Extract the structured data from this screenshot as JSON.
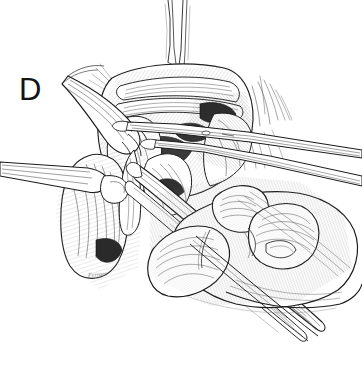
{
  "figure": {
    "panel_label": "D",
    "artist_signature": "Ferraro",
    "medium": "pen-and-ink line drawing",
    "background_color": "#ffffff",
    "ink_color": "#1a1a1a",
    "shadow_color": "#2b2b2b",
    "midtone_color": "#888888",
    "width": 362,
    "height": 381
  },
  "scene": {
    "description": "Pen-and-ink surgical illustration showing a retracted operative field held open with rake retractors and suture stay-sutures, while a gloved hand steadies long forceps and a dissecting instrument within the wound.",
    "elements": [
      {
        "name": "operative-field",
        "label": "Retracted operative field"
      },
      {
        "name": "rake-retractor-left",
        "label": "Rake retractor, left"
      },
      {
        "name": "rake-retractor-lower-left",
        "label": "Rake retractor, lower left"
      },
      {
        "name": "stay-sutures-superior",
        "label": "Superior stay sutures"
      },
      {
        "name": "suture-tails-right",
        "label": "Suture tails, right"
      },
      {
        "name": "forceps-upper",
        "label": "Long tissue forceps"
      },
      {
        "name": "forceps-lower",
        "label": "Second forceps / dissector"
      },
      {
        "name": "surgeon-hand",
        "label": "Surgeon's hand"
      },
      {
        "name": "index-finger",
        "label": "Index finger"
      },
      {
        "name": "middle-finger",
        "label": "Middle finger"
      },
      {
        "name": "thumb",
        "label": "Thumb"
      },
      {
        "name": "tissue-flap-left",
        "label": "Reflected tissue flap, left"
      },
      {
        "name": "tissue-flap-right",
        "label": "Reflected tissue flap, right"
      },
      {
        "name": "deep-cavity-shadow",
        "label": "Deep wound cavity in shadow"
      }
    ]
  }
}
